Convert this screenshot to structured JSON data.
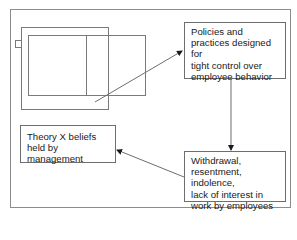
{
  "diagram": {
    "type": "cycle-flowchart",
    "nodes": [
      {
        "id": "policies",
        "label": "Policies and\npractices designed for\ntight control over\nemployee behavior"
      },
      {
        "id": "withdrawal",
        "label": "Withdrawal,\nresentment, indolence,\nlack of interest in\nwork by employees"
      },
      {
        "id": "theory_x",
        "label": "Theory X beliefs\nheld by management"
      }
    ],
    "edges": [
      {
        "from": "layered-rectangles",
        "to": "policies"
      },
      {
        "from": "policies",
        "to": "withdrawal"
      },
      {
        "from": "withdrawal",
        "to": "theory_x"
      }
    ],
    "colors": {
      "line": "#6e6e6e",
      "frame": "#8c8c8c",
      "text": "#1a1a1a",
      "background": "#ffffff"
    }
  }
}
